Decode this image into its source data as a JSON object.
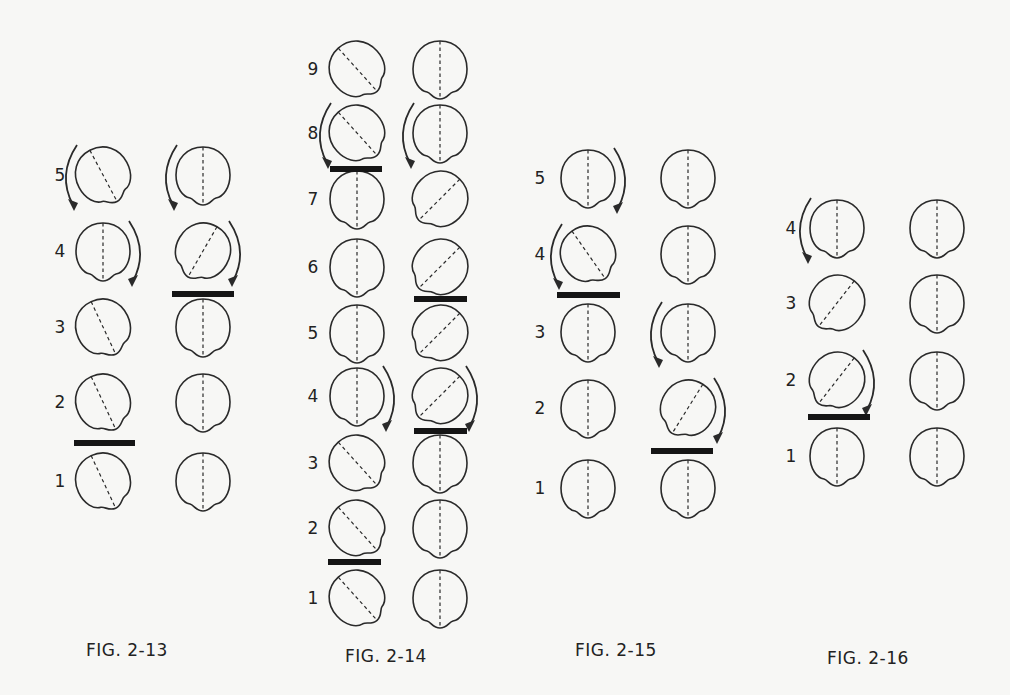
{
  "figures": [
    {
      "id": "fig-2-13",
      "caption": "FIG. 2-13",
      "caption_pos": [
        86,
        640
      ],
      "label_x": 60,
      "col_x": [
        103,
        203
      ],
      "rows": [
        {
          "label": "5",
          "y": 175,
          "seeds": [
            {
              "rot": -28,
              "arrow": "left"
            },
            {
              "rot": 0,
              "arrow": "left"
            }
          ]
        },
        {
          "label": "4",
          "y": 251,
          "seeds": [
            {
              "rot": 0,
              "arrow": "right"
            },
            {
              "rot": 30,
              "arrow": "right"
            }
          ]
        },
        {
          "label": "3",
          "y": 327,
          "seeds": [
            {
              "rot": -25,
              "arrow": ""
            },
            {
              "rot": 0,
              "arrow": ""
            }
          ]
        },
        {
          "label": "2",
          "y": 402,
          "seeds": [
            {
              "rot": -25,
              "arrow": ""
            },
            {
              "rot": 0,
              "arrow": ""
            }
          ]
        },
        {
          "label": "1",
          "y": 481,
          "seeds": [
            {
              "rot": -25,
              "arrow": ""
            },
            {
              "rot": 0,
              "arrow": ""
            }
          ]
        }
      ],
      "bars": [
        {
          "x": 172,
          "y": 291,
          "w": 62
        },
        {
          "x": 74,
          "y": 440,
          "w": 61
        }
      ]
    },
    {
      "id": "fig-2-14",
      "caption": "FIG. 2-14",
      "caption_pos": [
        345,
        646
      ],
      "label_x": 313,
      "col_x": [
        357,
        440
      ],
      "rows": [
        {
          "label": "9",
          "y": 69,
          "seeds": [
            {
              "rot": -42,
              "arrow": ""
            },
            {
              "rot": 0,
              "arrow": ""
            }
          ]
        },
        {
          "label": "8",
          "y": 133,
          "seeds": [
            {
              "rot": -42,
              "arrow": "left"
            },
            {
              "rot": 0,
              "arrow": "left"
            }
          ]
        },
        {
          "label": "7",
          "y": 199,
          "seeds": [
            {
              "rot": 0,
              "arrow": ""
            },
            {
              "rot": 45,
              "arrow": ""
            }
          ]
        },
        {
          "label": "6",
          "y": 267,
          "seeds": [
            {
              "rot": 0,
              "arrow": ""
            },
            {
              "rot": 45,
              "arrow": ""
            }
          ]
        },
        {
          "label": "5",
          "y": 333,
          "seeds": [
            {
              "rot": 0,
              "arrow": ""
            },
            {
              "rot": 45,
              "arrow": ""
            }
          ]
        },
        {
          "label": "4",
          "y": 396,
          "seeds": [
            {
              "rot": 0,
              "arrow": "right"
            },
            {
              "rot": 45,
              "arrow": "right"
            }
          ]
        },
        {
          "label": "3",
          "y": 463,
          "seeds": [
            {
              "rot": -42,
              "arrow": ""
            },
            {
              "rot": 0,
              "arrow": ""
            }
          ]
        },
        {
          "label": "2",
          "y": 528,
          "seeds": [
            {
              "rot": -42,
              "arrow": ""
            },
            {
              "rot": 0,
              "arrow": ""
            }
          ]
        },
        {
          "label": "1",
          "y": 598,
          "seeds": [
            {
              "rot": -42,
              "arrow": ""
            },
            {
              "rot": 0,
              "arrow": ""
            }
          ]
        }
      ],
      "bars": [
        {
          "x": 330,
          "y": 166,
          "w": 52
        },
        {
          "x": 414,
          "y": 296,
          "w": 53
        },
        {
          "x": 414,
          "y": 428,
          "w": 53
        },
        {
          "x": 328,
          "y": 559,
          "w": 53
        }
      ]
    },
    {
      "id": "fig-2-15",
      "caption": "FIG. 2-15",
      "caption_pos": [
        575,
        640
      ],
      "label_x": 540,
      "col_x": [
        588,
        688
      ],
      "rows": [
        {
          "label": "5",
          "y": 178,
          "seeds": [
            {
              "rot": 0,
              "arrow": "right"
            },
            {
              "rot": 0,
              "arrow": ""
            }
          ]
        },
        {
          "label": "4",
          "y": 254,
          "seeds": [
            {
              "rot": -35,
              "arrow": "left"
            },
            {
              "rot": 0,
              "arrow": ""
            }
          ]
        },
        {
          "label": "3",
          "y": 332,
          "seeds": [
            {
              "rot": 0,
              "arrow": ""
            },
            {
              "rot": 0,
              "arrow": "left"
            }
          ]
        },
        {
          "label": "2",
          "y": 408,
          "seeds": [
            {
              "rot": 0,
              "arrow": ""
            },
            {
              "rot": 32,
              "arrow": "right"
            }
          ]
        },
        {
          "label": "1",
          "y": 488,
          "seeds": [
            {
              "rot": 0,
              "arrow": ""
            },
            {
              "rot": 0,
              "arrow": ""
            }
          ]
        }
      ],
      "bars": [
        {
          "x": 557,
          "y": 292,
          "w": 63
        },
        {
          "x": 651,
          "y": 448,
          "w": 62
        }
      ]
    },
    {
      "id": "fig-2-16",
      "caption": "FIG. 2-16",
      "caption_pos": [
        827,
        648
      ],
      "label_x": 791,
      "col_x": [
        837,
        937
      ],
      "rows": [
        {
          "label": "4",
          "y": 228,
          "seeds": [
            {
              "rot": 0,
              "arrow": "left"
            },
            {
              "rot": 0,
              "arrow": ""
            }
          ]
        },
        {
          "label": "3",
          "y": 303,
          "seeds": [
            {
              "rot": 38,
              "arrow": ""
            },
            {
              "rot": 0,
              "arrow": ""
            }
          ]
        },
        {
          "label": "2",
          "y": 380,
          "seeds": [
            {
              "rot": 38,
              "arrow": "right"
            },
            {
              "rot": 0,
              "arrow": ""
            }
          ]
        },
        {
          "label": "1",
          "y": 456,
          "seeds": [
            {
              "rot": 0,
              "arrow": ""
            },
            {
              "rot": 0,
              "arrow": ""
            }
          ]
        }
      ],
      "bars": [
        {
          "x": 808,
          "y": 414,
          "w": 62
        }
      ]
    }
  ],
  "style": {
    "ink": "#2a2a2a",
    "bar_color": "#151515",
    "paper": "#f7f7f5"
  }
}
